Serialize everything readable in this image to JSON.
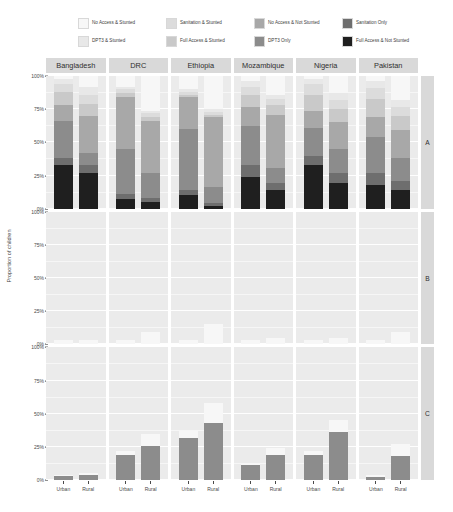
{
  "chart_data": {
    "type": "bar",
    "subtype": "stacked-percent-faceted",
    "title": "",
    "xlabel": "",
    "ylabel": "Proportion of children",
    "ylim": [
      0,
      100
    ],
    "ytick_labels": [
      "0%",
      "25%",
      "50%",
      "75%",
      "100%"
    ],
    "ytick_values": [
      0,
      25,
      50,
      75,
      100
    ],
    "grid": true,
    "legend_position": "top",
    "col_facets": [
      "Bangladesh",
      "DRC",
      "Ethiopia",
      "Mozambique",
      "Nigeria",
      "Pakistan"
    ],
    "row_facets": [
      "A",
      "B",
      "C"
    ],
    "x_categories": [
      "Urban",
      "Rural"
    ],
    "series": [
      {
        "name": "No Access & Stunted",
        "color": "#f7f7f7"
      },
      {
        "name": "DPT3 & Stunted",
        "color": "#e8e8e8"
      },
      {
        "name": "Sanitation & Stunted",
        "color": "#dcdcdc"
      },
      {
        "name": "Full Access & Stunted",
        "color": "#c9c9c9"
      },
      {
        "name": "No Access & Not Stunted",
        "color": "#a8a8a8"
      },
      {
        "name": "DPT3 Only",
        "color": "#8c8c8c"
      },
      {
        "name": "Sanitation Only",
        "color": "#6e6e6e"
      },
      {
        "name": "Full Access & Not Stunted",
        "color": "#1f1f1f"
      }
    ],
    "panels": [
      {
        "row": "A",
        "col": "Bangladesh",
        "bars": [
          {
            "x": "Urban",
            "values": [
              2,
              4,
              6,
              10,
              12,
              28,
              5,
              33
            ]
          },
          {
            "x": "Rural",
            "values": [
              8,
              6,
              7,
              9,
              28,
              9,
              6,
              27
            ]
          }
        ]
      },
      {
        "row": "A",
        "col": "DRC",
        "bars": [
          {
            "x": "Urban",
            "values": [
              8,
              2,
              3,
              3,
              39,
              34,
              4,
              7
            ]
          },
          {
            "x": "Rural",
            "values": [
              26,
              2,
              3,
              3,
              39,
              19,
              3,
              5
            ]
          }
        ]
      },
      {
        "row": "A",
        "col": "Ethiopia",
        "bars": [
          {
            "x": "Urban",
            "values": [
              10,
              2,
              2,
              2,
              24,
              46,
              4,
              10
            ]
          },
          {
            "x": "Rural",
            "values": [
              25,
              2,
              2,
              2,
              53,
              12,
              2,
              2
            ]
          }
        ]
      },
      {
        "row": "A",
        "col": "Mozambique",
        "bars": [
          {
            "x": "Urban",
            "values": [
              4,
              4,
              6,
              9,
              15,
              29,
              9,
              24
            ]
          },
          {
            "x": "Rural",
            "values": [
              14,
              3,
              5,
              7,
              40,
              12,
              5,
              14
            ]
          }
        ]
      },
      {
        "row": "A",
        "col": "Nigeria",
        "bars": [
          {
            "x": "Urban",
            "values": [
              2,
              4,
              8,
              12,
              13,
              21,
              7,
              33
            ]
          },
          {
            "x": "Rural",
            "values": [
              13,
              5,
              7,
              10,
              20,
              18,
              8,
              19
            ]
          }
        ]
      },
      {
        "row": "A",
        "col": "Pakistan",
        "bars": [
          {
            "x": "Urban",
            "values": [
              4,
              5,
              8,
              14,
              15,
              27,
              9,
              18
            ]
          },
          {
            "x": "Rural",
            "values": [
              18,
              5,
              7,
              11,
              21,
              17,
              7,
              14
            ]
          }
        ]
      },
      {
        "row": "B",
        "col": "Bangladesh",
        "bars": [
          {
            "x": "Urban",
            "values": [
              3,
              0,
              0,
              0,
              0,
              0,
              0,
              0
            ]
          },
          {
            "x": "Rural",
            "values": [
              3,
              0,
              0,
              0,
              0,
              0,
              0,
              0
            ]
          }
        ]
      },
      {
        "row": "B",
        "col": "DRC",
        "bars": [
          {
            "x": "Urban",
            "values": [
              3,
              0,
              0,
              0,
              0,
              0,
              0,
              0
            ]
          },
          {
            "x": "Rural",
            "values": [
              9,
              0,
              0,
              0,
              0,
              0,
              0,
              0
            ]
          }
        ]
      },
      {
        "row": "B",
        "col": "Ethiopia",
        "bars": [
          {
            "x": "Urban",
            "values": [
              3,
              0,
              0,
              0,
              0,
              0,
              0,
              0
            ]
          },
          {
            "x": "Rural",
            "values": [
              15,
              0,
              0,
              0,
              0,
              0,
              0,
              0
            ]
          }
        ]
      },
      {
        "row": "B",
        "col": "Mozambique",
        "bars": [
          {
            "x": "Urban",
            "values": [
              3,
              0,
              0,
              0,
              0,
              0,
              0,
              0
            ]
          },
          {
            "x": "Rural",
            "values": [
              5,
              0,
              0,
              0,
              0,
              0,
              0,
              0
            ]
          }
        ]
      },
      {
        "row": "B",
        "col": "Nigeria",
        "bars": [
          {
            "x": "Urban",
            "values": [
              3,
              0,
              0,
              0,
              0,
              0,
              0,
              0
            ]
          },
          {
            "x": "Rural",
            "values": [
              5,
              0,
              0,
              0,
              0,
              0,
              0,
              0
            ]
          }
        ]
      },
      {
        "row": "B",
        "col": "Pakistan",
        "bars": [
          {
            "x": "Urban",
            "values": [
              3,
              0,
              0,
              0,
              0,
              0,
              0,
              0
            ]
          },
          {
            "x": "Rural",
            "values": [
              9,
              0,
              0,
              0,
              0,
              0,
              0,
              0
            ]
          }
        ]
      },
      {
        "row": "C",
        "col": "Bangladesh",
        "bars": [
          {
            "x": "Urban",
            "values": [
              1,
              0,
              0,
              0,
              0,
              3,
              0,
              0
            ]
          },
          {
            "x": "Rural",
            "values": [
              1,
              0,
              0,
              0,
              0,
              4,
              0,
              0
            ]
          }
        ]
      },
      {
        "row": "C",
        "col": "DRC",
        "bars": [
          {
            "x": "Urban",
            "values": [
              3,
              0,
              0,
              0,
              0,
              19,
              0,
              0
            ]
          },
          {
            "x": "Rural",
            "values": [
              9,
              0,
              0,
              0,
              0,
              26,
              0,
              0
            ]
          }
        ]
      },
      {
        "row": "C",
        "col": "Ethiopia",
        "bars": [
          {
            "x": "Urban",
            "values": [
              5,
              0,
              0,
              0,
              0,
              32,
              0,
              0
            ]
          },
          {
            "x": "Rural",
            "values": [
              15,
              0,
              0,
              0,
              0,
              43,
              0,
              0
            ]
          }
        ]
      },
      {
        "row": "C",
        "col": "Mozambique",
        "bars": [
          {
            "x": "Urban",
            "values": [
              2,
              0,
              0,
              0,
              0,
              11,
              0,
              0
            ]
          },
          {
            "x": "Rural",
            "values": [
              5,
              0,
              0,
              0,
              0,
              19,
              0,
              0
            ]
          }
        ]
      },
      {
        "row": "C",
        "col": "Nigeria",
        "bars": [
          {
            "x": "Urban",
            "values": [
              3,
              0,
              0,
              0,
              0,
              19,
              0,
              0
            ]
          },
          {
            "x": "Rural",
            "values": [
              9,
              0,
              0,
              0,
              0,
              36,
              0,
              0
            ]
          }
        ]
      },
      {
        "row": "C",
        "col": "Pakistan",
        "bars": [
          {
            "x": "Urban",
            "values": [
              2,
              0,
              0,
              0,
              0,
              2,
              0,
              0
            ]
          },
          {
            "x": "Rural",
            "values": [
              9,
              0,
              0,
              0,
              0,
              18,
              0,
              0
            ]
          }
        ]
      }
    ]
  },
  "legend": {
    "items": [
      {
        "label": "No Access & Stunted",
        "color": "#f7f7f7"
      },
      {
        "label": "DPT3 & Stunted",
        "color": "#e8e8e8"
      },
      {
        "label": "Sanitation & Stunted",
        "color": "#dcdcdc"
      },
      {
        "label": "Full Access & Stunted",
        "color": "#c9c9c9"
      },
      {
        "label": "No Access & Not Stunted",
        "color": "#a8a8a8"
      },
      {
        "label": "DPT3 Only",
        "color": "#8c8c8c"
      },
      {
        "label": "Sanitation Only",
        "color": "#6e6e6e"
      },
      {
        "label": "Full Access & Not Stunted",
        "color": "#1f1f1f"
      }
    ]
  },
  "axes": {
    "y_title": "Proportion of children",
    "y_ticks": [
      "100%",
      "75%",
      "50%",
      "25%",
      "0%"
    ],
    "x_ticks": [
      "Urban",
      "Rural"
    ]
  },
  "strips": {
    "columns": [
      "Bangladesh",
      "DRC",
      "Ethiopia",
      "Mozambique",
      "Nigeria",
      "Pakistan"
    ],
    "rows": [
      "A",
      "B",
      "C"
    ]
  },
  "colors": {
    "panel_bg": "#ebebeb",
    "strip_bg": "#d9d9d9",
    "gridline": "#ffffff",
    "text": "#3d3d3d"
  }
}
